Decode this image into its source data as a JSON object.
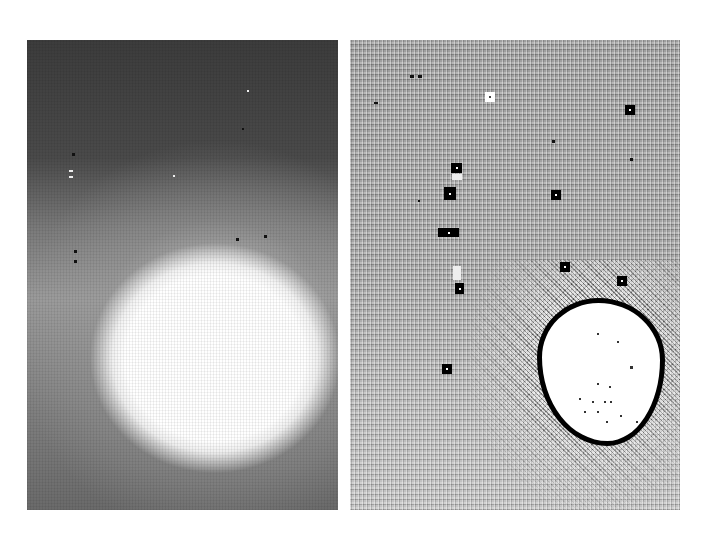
{
  "figure": {
    "panels": [
      {
        "id": "left",
        "description": "grayscale intensity image: dark upper region, large bright saturated blob in lower-center",
        "bright_region": {
          "center_x": 188,
          "center_y": 318,
          "approx_radius_x": 125,
          "approx_radius_y": 115
        }
      },
      {
        "id": "right",
        "description": "processed/thresholded image with square detection markers and an outlined segmented region",
        "markers": [
          {
            "x": 139,
            "y": 58,
            "type": "white"
          },
          {
            "x": 280,
            "y": 70,
            "type": "black"
          },
          {
            "x": 106,
            "y": 128,
            "type": "black"
          },
          {
            "x": 100,
            "y": 153,
            "type": "black"
          },
          {
            "x": 206,
            "y": 155,
            "type": "black"
          },
          {
            "x": 94,
            "y": 193,
            "type": "black"
          },
          {
            "x": 104,
            "y": 193,
            "type": "black"
          },
          {
            "x": 215,
            "y": 227,
            "type": "black"
          },
          {
            "x": 272,
            "y": 241,
            "type": "black"
          },
          {
            "x": 110,
            "y": 249,
            "type": "black"
          },
          {
            "x": 97,
            "y": 329,
            "type": "black"
          }
        ],
        "segmented_region": {
          "center_x": 246,
          "center_y": 327,
          "width": 118,
          "height": 138,
          "outline_color": "#000000"
        }
      }
    ]
  }
}
